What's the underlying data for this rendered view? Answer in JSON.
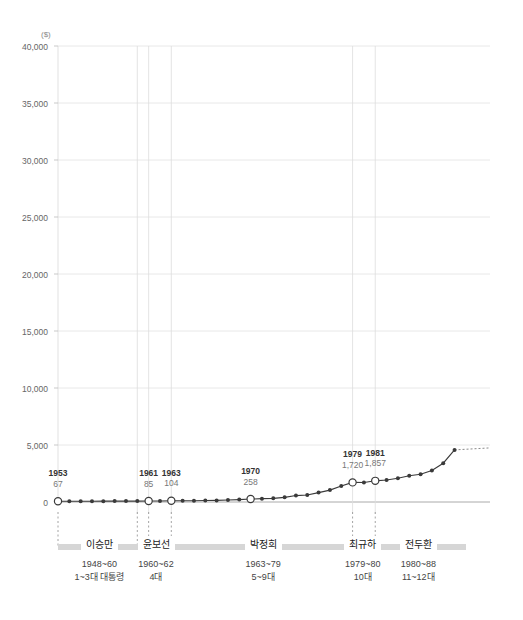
{
  "chart_data": {
    "type": "line",
    "title": "",
    "subtitle": "",
    "xlabel": "",
    "ylabel": "",
    "unit_label": "($)",
    "ylim": [
      0,
      40000
    ],
    "ytick_labels": [
      "40,000",
      "35,000",
      "30,000",
      "25,000",
      "20,000",
      "15,000",
      "10,000",
      "5,000",
      "0"
    ],
    "ytick_values": [
      40000,
      35000,
      30000,
      25000,
      20000,
      15000,
      10000,
      5000,
      0
    ],
    "grid": true,
    "legend": "none",
    "xlim": [
      1953,
      1989
    ],
    "x": [
      1953,
      1954,
      1955,
      1956,
      1957,
      1958,
      1959,
      1960,
      1961,
      1962,
      1963,
      1964,
      1965,
      1966,
      1967,
      1968,
      1969,
      1970,
      1971,
      1972,
      1973,
      1974,
      1975,
      1976,
      1977,
      1978,
      1979,
      1980,
      1981,
      1982,
      1983,
      1984,
      1985,
      1986,
      1987,
      1988
    ],
    "values": [
      67,
      70,
      65,
      70,
      74,
      80,
      81,
      79,
      85,
      91,
      104,
      107,
      108,
      125,
      142,
      169,
      210,
      258,
      292,
      322,
      406,
      563,
      608,
      824,
      1043,
      1406,
      1720,
      1704,
      1857,
      1927,
      2076,
      2300,
      2432,
      2759,
      3402,
      4571
    ],
    "highlighted_points": [
      {
        "year": 1953,
        "value": 67,
        "label_year": "1953",
        "label_value": "67"
      },
      {
        "year": 1961,
        "value": 85,
        "label_year": "1961",
        "label_value": "85"
      },
      {
        "year": 1963,
        "value": 104,
        "label_year": "1963",
        "label_value": "104"
      },
      {
        "year": 1970,
        "value": 258,
        "label_year": "1970",
        "label_value": "258"
      },
      {
        "year": 1979,
        "value": 1720,
        "label_year": "1979",
        "label_value": "1,720"
      },
      {
        "year": 1981,
        "value": 1857,
        "label_year": "1981",
        "label_value": "1,857"
      }
    ],
    "vertical_marker_years": [
      1960,
      1961,
      1963,
      1979,
      1981
    ],
    "line_color": "#3a3a3a",
    "marker_fill": "#ffffff",
    "grid_color": "#e2e2e2",
    "bar_color": "#d6d6d6"
  },
  "presidents": [
    {
      "name": "이승만",
      "term": "1948~60",
      "order": "1~3대 대통령"
    },
    {
      "name": "윤보선",
      "term": "1960~62",
      "order": "4대"
    },
    {
      "name": "박정희",
      "term": "1963~79",
      "order": "5~9대"
    },
    {
      "name": "최규하",
      "term": "1979~80",
      "order": "10대"
    },
    {
      "name": "전두환",
      "term": "1980~88",
      "order": "11~12대"
    }
  ]
}
